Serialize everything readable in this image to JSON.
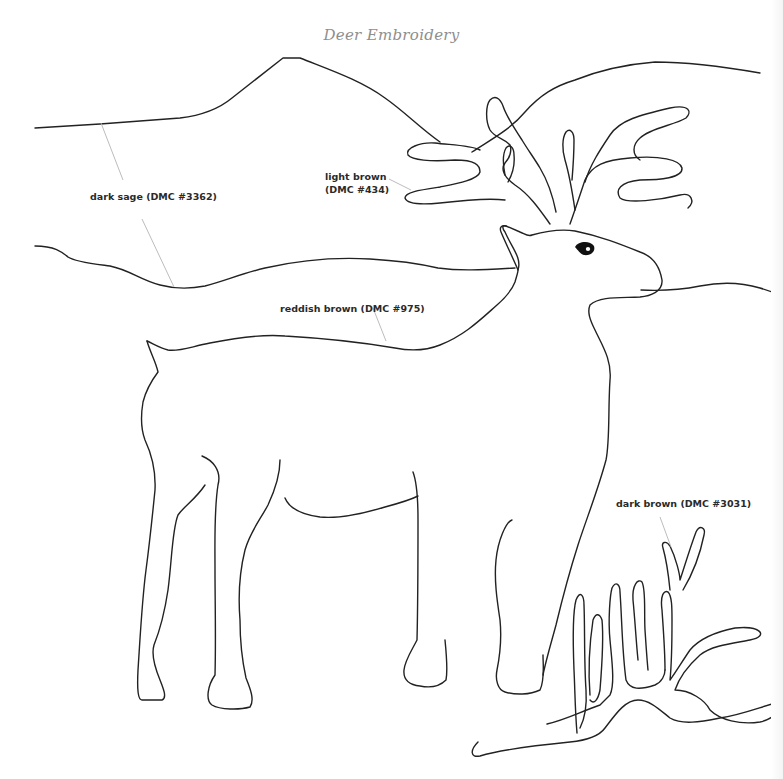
{
  "title": "Deer Embroidery",
  "colors": {
    "outline": "#222222",
    "leader": "#b4b4b4",
    "title": "#8e8e8e",
    "label": "#2a2a2a",
    "background": "#ffffff"
  },
  "labels": [
    {
      "id": "dark-sage",
      "text": "dark sage (DMC #3362)",
      "thread": "DMC #3362",
      "color_name": "dark sage",
      "region": "mountains / background hills"
    },
    {
      "id": "light-brown",
      "line1": "light brown",
      "line2": "(DMC #434)",
      "thread": "DMC #434",
      "color_name": "light brown",
      "region": "antlers"
    },
    {
      "id": "reddish-brown",
      "text": "reddish brown (DMC #975)",
      "thread": "DMC #975",
      "color_name": "reddish brown",
      "region": "deer body"
    },
    {
      "id": "dark-brown",
      "text": "dark brown (DMC #3031)",
      "thread": "DMC #3031",
      "color_name": "dark brown",
      "region": "fallen branch"
    }
  ],
  "shapes": {
    "mountain_back": "M35 128 L100 124 L180 118 C205 115 220 108 232 98 L283 58 L300 58 C330 70 360 80 385 98 C405 112 420 128 440 142",
    "mountain_back_right": "M472 152 C490 140 510 130 525 112 C540 95 555 86 575 80 C600 70 630 64 655 62 C680 62 720 66 760 73",
    "hill_front_left": "M35 246 C55 246 62 252 68 257 C75 262 95 264 110 266 C130 270 140 280 160 285 C175 289 190 289 205 286 C225 281 240 274 265 268 C300 260 335 257 370 259 C405 261 425 265 438 268 C460 271 480 270 515 268",
    "hill_front_right": "M641 290 C660 291 680 290 700 286 C720 282 740 282 760 288 C770 291 775 293 780 295",
    "deer_body": "M147 341 C152 343 160 348 168 350 C178 352 190 347 210 343 C235 338 262 334 285 336 C320 338 360 342 395 348 C410 351 425 351 440 345 C465 335 480 320 497 305 C505 298 512 290 515 282 C516 278 518 273 518 270 C522 258 512 248 505 232 C502 228 502 225 506 226 L520 232 C525 234 528 237 532 235 C550 230 562 229 575 231 C600 236 620 244 640 252 C655 257 660 268 662 280 C663 292 650 296 640 297 C620 298 600 296 590 305 C587 312 590 320 595 330 C602 345 612 360 610 380 C608 410 610 440 606 460 C598 490 586 520 578 545 C570 570 562 600 556 625 C552 640 546 660 543 675",
    "deer_tail_rump": "M147 341 C150 352 156 362 158 372 C152 380 146 390 143 402 C140 420 142 432 145 440 C152 455 156 470 155 490 C153 510 150 540 146 570 C142 600 140 640 138 670 C137 690 138 700 142 700 L162 700 C167 698 164 690 160 680 C155 668 151 655 154 645 C160 630 165 610 168 590 C172 560 172 530 178 515 C185 505 195 500 205 485",
    "deer_hind_leg2": "M202 456 C212 460 222 470 218 485 C214 510 215 540 215 570 C215 600 216 640 215 675 C208 685 205 700 212 705 C220 710 240 710 250 707 C255 700 250 688 246 678 C242 660 240 640 240 620 C238 595 240 570 245 550 C250 532 260 520 268 505 C275 490 280 475 280 460",
    "deer_belly": "M285 498 C290 510 305 515 320 517 C340 519 365 513 385 507 C400 503 410 500 418 496",
    "deer_front_leg": "M413 472 C416 480 418 500 418 520 C418 560 418 600 417 640 C412 650 405 660 404 670 C403 680 410 685 420 686 C430 688 440 686 446 680 C448 670 446 650 445 640",
    "deer_front_leg2": "M512 520 C506 522 498 540 496 560 C494 580 497 600 500 620 C502 640 500 655 497 670 C495 680 498 690 505 692 C515 695 530 695 540 690 C545 680 543 665 543 655",
    "head_neck": "M497 305 C505 298 508 290 505 282 C502 272 500 260 500 250",
    "ear": "M518 270 C513 258 506 244 501 232 C499 227 502 225 506 226",
    "antler_left": "M550 224 C540 210 530 195 515 185 C505 178 500 170 505 163 C510 158 512 150 510 145 C504 138 495 138 490 130 C485 120 486 105 490 100 C495 95 500 98 503 106 C506 115 514 128 522 140 C528 150 534 158 540 168 C546 178 552 192 556 212",
    "antler_left_tines": "M480 150 C470 145 450 145 435 143 C420 142 405 148 408 155 C412 160 430 162 455 160 C475 160 480 165 480 172 C478 180 455 184 440 187 C420 190 405 192 405 198 C407 204 420 205 440 203 C465 200 490 198 505 200",
    "antler_left_small": "M505 175 C503 165 502 155 506 148 C510 143 514 148 514 155 C515 165 512 175 508 182",
    "antler_right": "M570 224 C575 210 580 195 585 180 C592 165 605 160 630 158 C660 155 680 160 682 168 C683 178 660 180 640 180 C620 182 615 190 620 198 C628 204 660 200 680 195 C692 192 695 202 688 208",
    "antler_right_outer": "M585 182 C590 165 600 150 610 135 C620 120 640 115 670 108 C690 104 692 112 686 118 C675 125 650 128 640 138 C632 145 632 155 640 160",
    "antler_right_inner": "M575 210 C572 190 568 170 565 160 C562 150 562 138 566 132 C570 128 574 132 574 140 C574 152 573 168 572 180",
    "branch": "M478 742 C470 750 470 758 480 756 C500 750 540 745 570 742 C590 740 600 735 605 728 C615 715 625 700 638 700 C650 700 660 710 670 718 C682 725 700 722 720 718 C745 714 765 705 780 702",
    "branch_upper": "M547 724 C565 720 580 712 600 705 L610 695 C615 684 612 662 610 640 C608 620 610 595 612 588 C616 580 620 585 620 592 C622 620 622 650 626 680 C630 690 640 690 655 685 C662 682 665 675 665 670",
    "branch_right": "M665 670 C665 650 663 625 662 610 C660 595 664 590 668 592 C672 596 672 608 672 620 C672 640 672 660 670 680 C676 672 683 660 690 650 C700 638 715 632 735 628 C760 625 770 636 750 640 C735 643 712 645 700 655 C690 664 680 675 675 690 C690 690 705 700 710 710 C720 720 740 725 760 722 C770 720 775 715 778 712",
    "branch_spikes": "M638 660 C636 640 635 620 633 600 C632 585 638 578 642 582 C646 590 644 610 645 630 C646 645 647 660 648 670 M577 733 C575 710 575 690 574 670 C573 645 572 615 576 600 C580 590 584 595 584 605 C585 630 584 660 586 690 C587 705 585 718 580 728 M590 695 C588 670 590 640 593 620 C596 612 600 614 602 620 C604 640 602 665 600 690 C598 700 594 705 590 700 M670 590 C668 570 665 555 663 548 C661 542 666 540 670 546 C676 558 680 575 680 580 C684 568 690 548 696 532 C700 524 706 528 704 535 C700 555 692 575 683 590"
  },
  "eye": {
    "cx": 584,
    "cy": 249
  }
}
